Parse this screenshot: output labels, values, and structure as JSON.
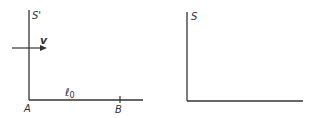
{
  "left_frame": {
    "frame_label": "S'",
    "velocity_label": "v",
    "length_label": "ℓ",
    "length_subscript": "0",
    "point_a": "A",
    "point_b": "B"
  },
  "right_frame": {
    "frame_label": "S"
  },
  "colors": {
    "stroke": "#333333",
    "background": "#ffffff"
  }
}
